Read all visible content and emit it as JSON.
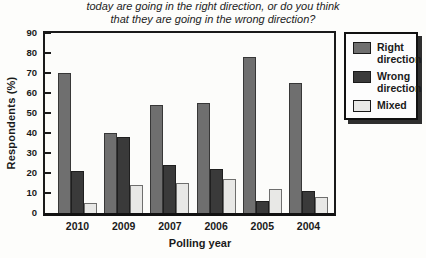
{
  "title": {
    "line1": "today are going in the right direction, or do you think",
    "line2": "that they are going in the wrong direction?"
  },
  "chart_data": {
    "type": "bar",
    "categories": [
      "2010",
      "2009",
      "2007",
      "2006",
      "2005",
      "2004"
    ],
    "series": [
      {
        "name": "Right direction",
        "color": "#6f6f6f",
        "values": [
          70,
          40,
          54,
          55,
          78,
          65
        ]
      },
      {
        "name": "Wrong direction",
        "color": "#3a3a3a",
        "values": [
          21,
          38,
          24,
          22,
          6,
          11
        ]
      },
      {
        "name": "Mixed",
        "color": "#e8e8e6",
        "values": [
          5,
          14,
          15,
          17,
          12,
          8
        ]
      }
    ],
    "xlabel": "Polling year",
    "ylabel": "Respondents (%)",
    "ylim": [
      0,
      90
    ],
    "ytick_step": 10,
    "grid": false,
    "legend_position": "right"
  }
}
